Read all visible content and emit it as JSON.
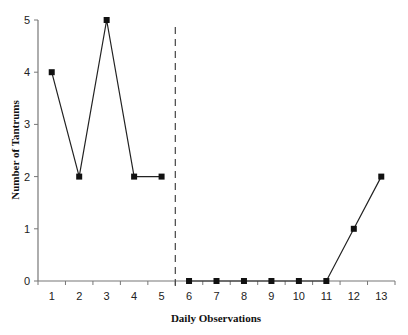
{
  "chart_data": {
    "type": "line",
    "title": "",
    "xlabel": "Daily Observations",
    "ylabel": "Number of Tantrums",
    "categories": [
      "1",
      "2",
      "3",
      "4",
      "5",
      "6",
      "7",
      "8",
      "9",
      "10",
      "11",
      "12",
      "13"
    ],
    "ylim": [
      0,
      5
    ],
    "yticks": [
      0,
      1,
      2,
      3,
      4,
      5
    ],
    "grid": false,
    "legend": null,
    "series": [
      {
        "name": "Baseline",
        "x": [
          1,
          2,
          3,
          4,
          5
        ],
        "values": [
          4,
          2,
          5,
          2,
          2
        ]
      },
      {
        "name": "Intervention",
        "x": [
          6,
          7,
          8,
          9,
          10,
          11,
          12,
          13
        ],
        "values": [
          0,
          0,
          0,
          0,
          0,
          0,
          1,
          2
        ]
      }
    ],
    "phase_change_line": {
      "between": [
        5,
        6
      ],
      "style": "dashed"
    },
    "colors": {
      "line": "#222222",
      "marker": "#111111",
      "axis": "#777777",
      "phase_line": "#444444"
    }
  }
}
